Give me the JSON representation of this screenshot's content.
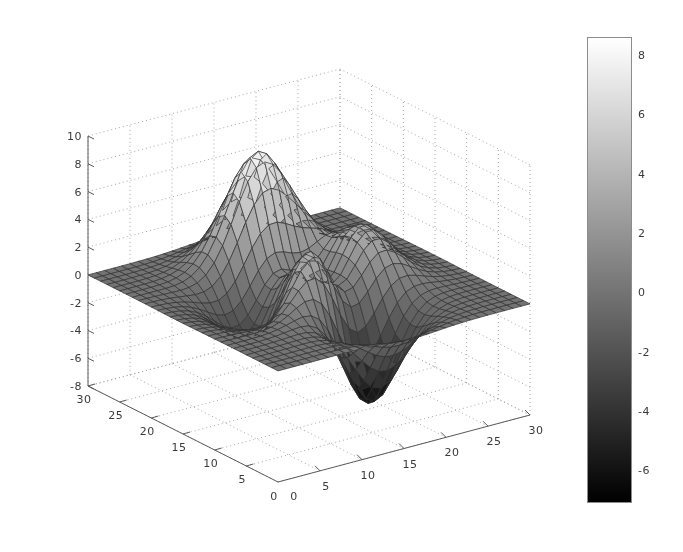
{
  "figure": {
    "background_color": "#ffffff",
    "width": 683,
    "height": 552
  },
  "chart_data": {
    "type": "surface",
    "title": "",
    "subtitle": "",
    "xlabel": "",
    "ylabel": "",
    "zlabel": "",
    "function": "peaks",
    "grid": true,
    "grid_style": "dotted",
    "colormap": "gray",
    "mesh_lines": true,
    "mesh_color": "#303030",
    "x": {
      "label": "",
      "ticks": [
        0,
        5,
        10,
        15,
        20,
        25,
        30
      ],
      "tick_labels": [
        "0",
        "5",
        "10",
        "15",
        "20",
        "25",
        "30"
      ],
      "range": [
        0,
        30
      ],
      "grid_n": 30
    },
    "y": {
      "label": "",
      "ticks": [
        0,
        5,
        10,
        15,
        20,
        25,
        30
      ],
      "tick_labels": [
        "0",
        "5",
        "10",
        "15",
        "20",
        "25",
        "30"
      ],
      "range": [
        0,
        30
      ],
      "grid_n": 30
    },
    "z": {
      "label": "",
      "ticks": [
        -8,
        -6,
        -4,
        -2,
        0,
        2,
        4,
        6,
        8,
        10
      ],
      "tick_labels": [
        "-8",
        "-6",
        "-4",
        "-2",
        "0",
        "2",
        "4",
        "6",
        "8",
        "10"
      ],
      "range": [
        -8,
        10
      ]
    },
    "zlim": [
      -8,
      10
    ],
    "data_min": -6.55,
    "data_max": 8.08,
    "view_azimuth": -37.5,
    "view_elevation": 30,
    "features": [
      {
        "name": "primary peak",
        "x": 9,
        "y": 19,
        "z": 8.08
      },
      {
        "name": "secondary peak",
        "x": 18,
        "y": 17,
        "z": 3.78
      },
      {
        "name": "deep trough",
        "x": 20,
        "y": 9,
        "z": -6.55
      },
      {
        "name": "shallow dip",
        "x": 6,
        "y": 12,
        "z": -3.05
      }
    ],
    "colorbar": {
      "orientation": "vertical",
      "ticks": [
        -6,
        -4,
        -2,
        0,
        2,
        4,
        6,
        8
      ],
      "tick_labels": [
        "-6",
        "-4",
        "-2",
        "0",
        "2",
        "4",
        "6",
        "8"
      ],
      "range": [
        -7.1,
        8.6
      ],
      "low_color": "#000000",
      "high_color": "#ffffff"
    }
  },
  "axes": {
    "line_color": "#5a5a5a",
    "grid_color": "#a8a8a8",
    "tick_text_color": "#3a3a3a",
    "z_axis_name": "z-axis",
    "x_axis_name": "x-axis",
    "y_axis_name": "y-axis"
  }
}
